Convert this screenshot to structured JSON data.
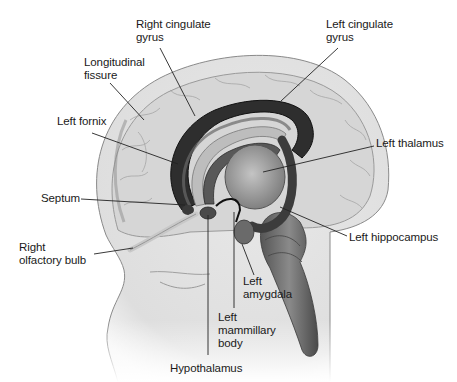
{
  "diagram": {
    "colors": {
      "background": "#ffffff",
      "head_fill": "#e4e4e4",
      "cortex_fill": "#d0d0d0",
      "cingulate_dark": "#2e2e2e",
      "inner_structures": "#5a5a5a",
      "thalamus_fill": "#9a9a9a",
      "brainstem_fill": "#6e6e6e",
      "label_text": "#1a1a1a",
      "leader_line": "#222222"
    },
    "labels": [
      {
        "id": "right-cingulate-gyrus",
        "text": "Right cingulate\ngyrus",
        "x": 136,
        "y": 18,
        "line": [
          [
            160,
            48
          ],
          [
            195,
            116
          ]
        ]
      },
      {
        "id": "left-cingulate-gyrus",
        "text": "Left cingulate\ngyrus",
        "x": 326,
        "y": 18,
        "line": [
          [
            338,
            48
          ],
          [
            281,
            101
          ]
        ]
      },
      {
        "id": "longitudinal-fissure",
        "text": "Longitudinal\nfissure",
        "x": 84,
        "y": 56,
        "line": [
          [
            110,
            83
          ],
          [
            144,
            120
          ]
        ]
      },
      {
        "id": "left-fornix",
        "text": "Left fornix",
        "x": 57,
        "y": 115,
        "line": [
          [
            92,
            133
          ],
          [
            178,
            164
          ]
        ]
      },
      {
        "id": "left-thalamus",
        "text": "Left thalamus",
        "x": 376,
        "y": 137,
        "line": [
          [
            374,
            146
          ],
          [
            263,
            172
          ]
        ]
      },
      {
        "id": "septum",
        "text": "Septum",
        "x": 41,
        "y": 192,
        "line": [
          [
            81,
            199
          ],
          [
            185,
            205
          ]
        ]
      },
      {
        "id": "left-hippocampus",
        "text": "Left hippocampus",
        "x": 349,
        "y": 231,
        "line": [
          [
            347,
            236
          ],
          [
            280,
            207
          ]
        ]
      },
      {
        "id": "right-olfactory-bulb",
        "text": "Right\nolfactory bulb",
        "x": 19,
        "y": 241,
        "line": [
          [
            94,
            254
          ],
          [
            133,
            248
          ]
        ]
      },
      {
        "id": "left-amygdala",
        "text": "Left\namygdala",
        "x": 243,
        "y": 275,
        "line": [
          [
            254,
            275
          ],
          [
            242,
            244
          ]
        ]
      },
      {
        "id": "left-mammillary-body",
        "text": "Left\nmammillary\nbody",
        "x": 218,
        "y": 311,
        "line": [
          [
            234,
            308
          ],
          [
            234,
            212
          ]
        ]
      },
      {
        "id": "hypothalamus",
        "text": "Hypothalamus",
        "x": 170,
        "y": 362,
        "line": [
          [
            208,
            355
          ],
          [
            208,
            215
          ]
        ]
      }
    ]
  }
}
